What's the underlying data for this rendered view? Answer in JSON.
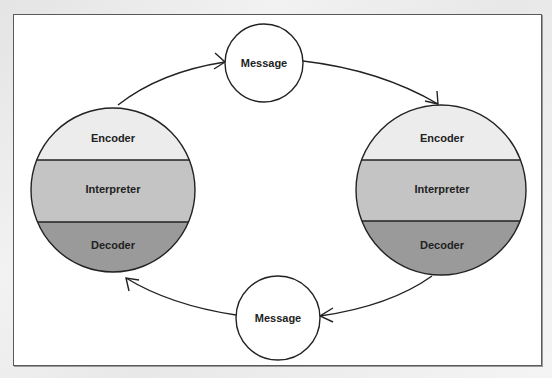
{
  "diagram": {
    "type": "communication-cycle",
    "nodes": {
      "message_top": {
        "label": "Message"
      },
      "message_bottom": {
        "label": "Message"
      },
      "left_party": {
        "bands": [
          {
            "label": "Encoder",
            "color": "#ececec"
          },
          {
            "label": "Interpreter",
            "color": "#c4c4c4"
          },
          {
            "label": "Decoder",
            "color": "#9a9a9a"
          }
        ]
      },
      "right_party": {
        "bands": [
          {
            "label": "Encoder",
            "color": "#ececec"
          },
          {
            "label": "Interpreter",
            "color": "#c4c4c4"
          },
          {
            "label": "Decoder",
            "color": "#9a9a9a"
          }
        ]
      }
    },
    "edges": [
      {
        "from": "left_party",
        "to": "message_top"
      },
      {
        "from": "message_top",
        "to": "right_party"
      },
      {
        "from": "right_party",
        "to": "message_bottom"
      },
      {
        "from": "message_bottom",
        "to": "left_party"
      }
    ]
  }
}
